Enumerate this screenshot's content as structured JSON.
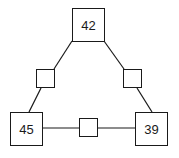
{
  "diagram": {
    "type": "triangle-number-puzzle",
    "corners": {
      "top": {
        "value": "42"
      },
      "bottom_left": {
        "value": "45"
      },
      "bottom_right": {
        "value": "39"
      }
    },
    "edges": {
      "left": {
        "value": ""
      },
      "right": {
        "value": ""
      },
      "bottom": {
        "value": ""
      }
    },
    "colors": {
      "stroke": "#1a1a1a",
      "background": "#ffffff"
    }
  }
}
